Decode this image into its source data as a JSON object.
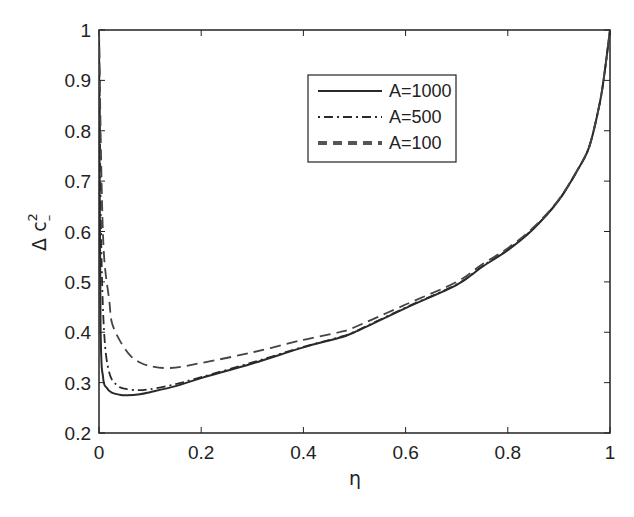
{
  "chart_data": {
    "type": "line",
    "title": "",
    "xlabel": "η",
    "ylabel": "Δ c²₋",
    "xlim": [
      0,
      1
    ],
    "ylim": [
      0.2,
      1
    ],
    "grid": false,
    "legend_position": "upper center (inside)",
    "x_ticks": [
      "0",
      "0.2",
      "0.4",
      "0.6",
      "0.8",
      "1"
    ],
    "y_ticks": [
      "0.2",
      "0.3",
      "0.4",
      "0.5",
      "0.6",
      "0.7",
      "0.8",
      "0.9",
      "1"
    ],
    "series": [
      {
        "name": "A=1000",
        "style": "solid",
        "x": [
          0.0,
          0.003,
          0.008,
          0.015,
          0.025,
          0.04,
          0.055,
          0.08,
          0.1,
          0.15,
          0.2,
          0.3,
          0.4,
          0.47,
          0.5,
          0.6,
          0.7,
          0.75,
          0.8,
          0.85,
          0.9,
          0.94,
          0.96,
          0.98,
          0.99,
          1.0
        ],
        "values": [
          1.0,
          0.42,
          0.31,
          0.29,
          0.28,
          0.276,
          0.275,
          0.277,
          0.281,
          0.293,
          0.309,
          0.338,
          0.37,
          0.389,
          0.4,
          0.448,
          0.494,
          0.53,
          0.563,
          0.605,
          0.662,
          0.728,
          0.77,
          0.855,
          0.92,
          1.0
        ]
      },
      {
        "name": "A=500",
        "style": "dash-dot",
        "x": [
          0.0,
          0.004,
          0.01,
          0.02,
          0.035,
          0.05,
          0.075,
          0.1,
          0.15,
          0.2,
          0.3,
          0.4,
          0.47,
          0.5,
          0.6,
          0.7,
          0.75,
          0.8,
          0.85,
          0.9,
          0.94,
          0.96,
          0.98,
          0.99,
          1.0
        ],
        "values": [
          1.0,
          0.6,
          0.4,
          0.32,
          0.295,
          0.288,
          0.285,
          0.287,
          0.297,
          0.311,
          0.34,
          0.371,
          0.39,
          0.401,
          0.449,
          0.495,
          0.531,
          0.564,
          0.606,
          0.663,
          0.728,
          0.77,
          0.855,
          0.92,
          1.0
        ]
      },
      {
        "name": "A=100",
        "style": "dashed",
        "x": [
          0.0,
          0.005,
          0.01,
          0.02,
          0.025,
          0.04,
          0.06,
          0.08,
          0.1,
          0.14,
          0.2,
          0.3,
          0.4,
          0.47,
          0.5,
          0.6,
          0.7,
          0.75,
          0.8,
          0.85,
          0.9,
          0.94,
          0.96,
          0.98,
          0.99,
          1.0
        ],
        "values": [
          1.0,
          0.7,
          0.55,
          0.464,
          0.42,
          0.385,
          0.355,
          0.34,
          0.333,
          0.329,
          0.339,
          0.36,
          0.385,
          0.4,
          0.41,
          0.455,
          0.5,
          0.535,
          0.567,
          0.608,
          0.664,
          0.729,
          0.771,
          0.855,
          0.92,
          1.0
        ]
      }
    ]
  },
  "legend": {
    "items": [
      {
        "label": "A=1000",
        "style": "solid"
      },
      {
        "label": "A=500",
        "style": "dash-dot"
      },
      {
        "label": "A=100",
        "style": "dashed"
      }
    ]
  },
  "axes": {
    "xlabel": "η",
    "ylabel_main": "Δ c",
    "ylabel_sup": "2",
    "ylabel_sub": "–"
  },
  "colors": {
    "line": "#2a2a2a",
    "axis": "#222222",
    "background": "#ffffff"
  }
}
